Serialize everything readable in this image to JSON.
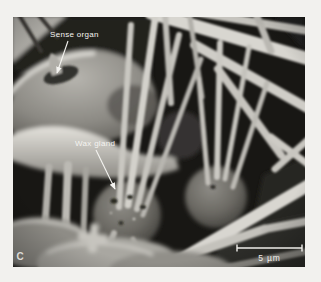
{
  "page": {
    "background_color": "#f2f1ee"
  },
  "micrograph": {
    "panel_label": "C",
    "labels": {
      "sense_organ": "Sense organ",
      "wax_gland": "Wax gland"
    },
    "scale_bar": {
      "label": "5 µm"
    },
    "colors": {
      "background": "#181714",
      "annotation_text": "#f4f3f0",
      "filaments": "#d4d2cc",
      "gland_spheres": "#6e6c66"
    }
  }
}
